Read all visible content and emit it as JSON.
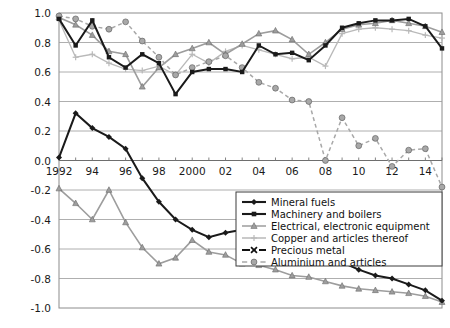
{
  "chart_data": {
    "type": "line",
    "title": "",
    "xlabel": "",
    "ylabel": "",
    "ylim": [
      -1.0,
      1.0
    ],
    "xlim": [
      1992,
      2015
    ],
    "grid": true,
    "legend_position": "bottom-right",
    "ytick_labels": [
      "1.0",
      "0.8",
      "0.6",
      "0.4",
      "0.2",
      "0.0",
      "-0.2",
      "-0.4",
      "-0.6",
      "-0.8",
      "-1.0"
    ],
    "ytick_values": [
      1.0,
      0.8,
      0.6,
      0.4,
      0.2,
      0.0,
      -0.2,
      -0.4,
      -0.6,
      -0.8,
      -1.0
    ],
    "x": [
      1992,
      1993,
      1994,
      1995,
      1996,
      1997,
      1998,
      1999,
      2000,
      2001,
      2002,
      2003,
      2004,
      2005,
      2006,
      2007,
      2008,
      2009,
      2010,
      2011,
      2012,
      2013,
      2014,
      2015
    ],
    "xtick_labels": [
      "1992",
      "94",
      "96",
      "98",
      "2000",
      "02",
      "04",
      "06",
      "08",
      "10",
      "12",
      "14"
    ],
    "xtick_values": [
      1992,
      1994,
      1996,
      1998,
      2000,
      2002,
      2004,
      2006,
      2008,
      2010,
      2012,
      2014
    ],
    "series": [
      {
        "name": "Mineral fuels",
        "color": "#1a1a1a",
        "marker": "diamond",
        "dash": "none",
        "width": 2.0,
        "values": [
          0.02,
          0.32,
          0.22,
          0.16,
          0.08,
          -0.12,
          -0.28,
          -0.4,
          -0.47,
          -0.52,
          -0.49,
          -0.47,
          -0.46,
          -0.47,
          -0.26,
          -0.61,
          -0.66,
          -0.69,
          -0.74,
          -0.78,
          -0.8,
          -0.84,
          -0.88,
          -0.95
        ]
      },
      {
        "name": "Machinery and boilers",
        "color": "#1a1a1a",
        "marker": "square",
        "dash": "none",
        "width": 2.0,
        "values": [
          0.96,
          0.78,
          0.95,
          0.7,
          0.63,
          0.72,
          0.66,
          0.45,
          0.6,
          0.62,
          0.62,
          0.6,
          0.78,
          0.72,
          0.73,
          0.68,
          0.78,
          0.9,
          0.93,
          0.95,
          0.95,
          0.96,
          0.91,
          0.76
        ]
      },
      {
        "name": "Electrical, electronic equipment",
        "color": "#9d9d9d",
        "marker": "triangle",
        "dash": "none",
        "width": 1.6,
        "values": [
          0.97,
          0.92,
          0.85,
          0.74,
          0.72,
          0.5,
          0.63,
          0.72,
          0.76,
          0.8,
          0.72,
          0.79,
          0.86,
          0.88,
          0.82,
          0.72,
          0.8,
          0.89,
          0.92,
          0.93,
          0.95,
          0.93,
          0.91,
          0.87
        ]
      },
      {
        "name": "Copper and articles thereof",
        "color": "#b9b9b9",
        "marker": "plus",
        "dash": "none",
        "width": 1.3,
        "values": [
          0.95,
          0.7,
          0.72,
          0.66,
          0.62,
          0.61,
          0.64,
          0.58,
          0.72,
          0.66,
          0.74,
          0.78,
          0.75,
          0.72,
          0.69,
          0.7,
          0.64,
          0.86,
          0.89,
          0.9,
          0.89,
          0.88,
          0.85,
          0.83
        ]
      },
      {
        "name": "Precious metal",
        "color": "#111111",
        "marker": "x",
        "dash": "dashdot",
        "width": 1.8,
        "values": [
          0.78,
          0.66,
          0.72,
          0.58,
          0.68,
          0.78,
          0.7,
          0.78,
          0.8,
          0.77,
          0.82,
          0.79,
          0.76,
          0.79,
          0.79,
          0.84,
          0.8,
          0.66,
          0.66,
          0.22,
          0.47,
          0.46,
          0.46,
          0.47
        ]
      },
      {
        "name": "Aluminium and articles",
        "color": "#a8a8a8",
        "marker": "circle",
        "dash": "dashed",
        "width": 1.5,
        "values": [
          0.98,
          0.96,
          0.91,
          0.89,
          0.94,
          0.81,
          0.7,
          0.58,
          0.63,
          0.67,
          0.71,
          0.63,
          0.53,
          0.49,
          0.41,
          0.4,
          0.0,
          0.29,
          0.1,
          0.15,
          -0.04,
          0.07,
          0.08,
          -0.18
        ]
      },
      {
        "name": "Electrical, electronic equipment (lower)",
        "color": "#9d9d9d",
        "marker": "triangle",
        "dash": "none",
        "width": 1.6,
        "hidden_from_legend": true,
        "values": [
          -0.19,
          -0.29,
          -0.4,
          -0.2,
          -0.42,
          -0.59,
          -0.7,
          -0.66,
          -0.54,
          -0.62,
          -0.64,
          -0.7,
          -0.71,
          -0.74,
          -0.78,
          -0.79,
          -0.82,
          -0.85,
          -0.87,
          -0.88,
          -0.89,
          -0.9,
          -0.92,
          -0.96
        ]
      }
    ],
    "legend_entries": [
      {
        "label": "Mineral fuels",
        "marker": "diamond",
        "color": "#1a1a1a",
        "dash": "none"
      },
      {
        "label": "Machinery and boilers",
        "marker": "square",
        "color": "#1a1a1a",
        "dash": "none"
      },
      {
        "label": "Electrical, electronic equipment",
        "marker": "triangle",
        "color": "#9d9d9d",
        "dash": "none"
      },
      {
        "label": "Copper and articles thereof",
        "marker": "plus",
        "color": "#b9b9b9",
        "dash": "none"
      },
      {
        "label": "Precious metal",
        "marker": "x",
        "color": "#111111",
        "dash": "dashdot"
      },
      {
        "label": "Aluminium and articles",
        "marker": "circle",
        "color": "#a8a8a8",
        "dash": "dashed"
      }
    ]
  }
}
